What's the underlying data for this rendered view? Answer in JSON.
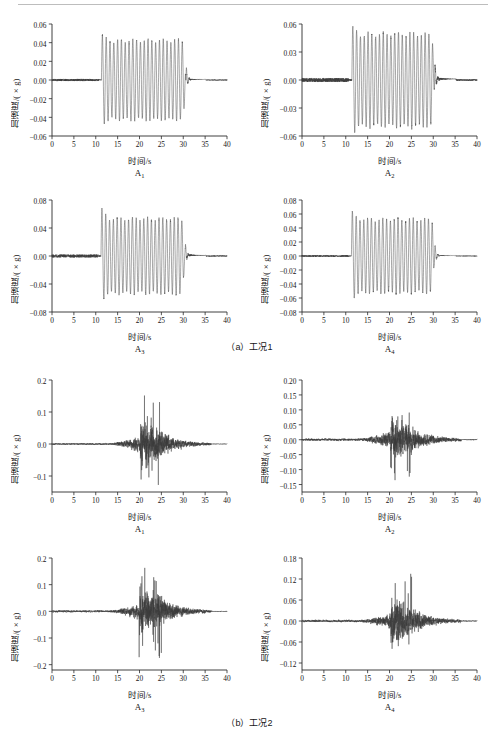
{
  "figure": {
    "axis_labels": {
      "y": "加速度/(×g)",
      "x": "时间/s"
    },
    "groups": [
      {
        "caption": "（a）工况1",
        "excitation": "harmonic-sine-sweep",
        "panels": [
          {
            "name": "A1",
            "label_main": "A",
            "label_sub": "1",
            "chart_data": {
              "type": "line",
              "title": "A1",
              "xlabel": "时间/s",
              "ylabel": "加速度/(×g)",
              "xlim": [
                0,
                40
              ],
              "ylim": [
                -0.06,
                0.06
              ],
              "xticks": [
                0,
                5,
                10,
                15,
                20,
                25,
                30,
                35,
                40
              ],
              "yticks": [
                -0.06,
                -0.04,
                -0.02,
                0.0,
                0.02,
                0.04,
                0.06
              ],
              "grid": false,
              "legend": "none",
              "waveform": "sine",
              "quiet_noise_amp": 0.0012,
              "onset_s": 11.3,
              "end_s": 30.6,
              "tail_end_s": 35.2,
              "peak_positive": 0.048,
              "peak_negative": -0.049,
              "steady_amp": 0.042,
              "cycles_per_second": 1.15
            }
          },
          {
            "name": "A2",
            "label_main": "A",
            "label_sub": "2",
            "chart_data": {
              "type": "line",
              "title": "A2",
              "xlabel": "时间/s",
              "ylabel": "加速度/(×g)",
              "xlim": [
                0,
                40
              ],
              "ylim": [
                -0.06,
                0.06
              ],
              "xticks": [
                0,
                5,
                10,
                15,
                20,
                25,
                30,
                35,
                40
              ],
              "yticks": [
                -0.06,
                -0.03,
                0.0,
                0.03,
                0.06
              ],
              "grid": false,
              "legend": "none",
              "waveform": "sine",
              "quiet_noise_amp": 0.0022,
              "onset_s": 11.4,
              "end_s": 30.3,
              "tail_end_s": 35.2,
              "peak_positive": 0.059,
              "peak_negative": -0.056,
              "steady_amp": 0.049,
              "cycles_per_second": 1.15
            }
          },
          {
            "name": "A3",
            "label_main": "A",
            "label_sub": "3",
            "chart_data": {
              "type": "line",
              "title": "A3",
              "xlabel": "时间/s",
              "ylabel": "加速度/(×g)",
              "xlim": [
                0,
                40
              ],
              "ylim": [
                -0.08,
                0.08
              ],
              "xticks": [
                0,
                5,
                10,
                15,
                20,
                25,
                30,
                35,
                40
              ],
              "yticks": [
                -0.08,
                -0.04,
                0.0,
                0.04,
                0.08
              ],
              "grid": false,
              "legend": "none",
              "waveform": "sine",
              "quiet_noise_amp": 0.0022,
              "onset_s": 11.2,
              "end_s": 30.4,
              "tail_end_s": 35.2,
              "peak_positive": 0.07,
              "peak_negative": -0.068,
              "steady_amp": 0.053,
              "cycles_per_second": 1.15
            }
          },
          {
            "name": "A4",
            "label_main": "A",
            "label_sub": "4",
            "chart_data": {
              "type": "line",
              "title": "A4",
              "xlabel": "时间/s",
              "ylabel": "加速度/(×g)",
              "xlim": [
                0,
                40
              ],
              "ylim": [
                -0.08,
                0.08
              ],
              "xticks": [
                0,
                5,
                10,
                15,
                20,
                25,
                30,
                35,
                40
              ],
              "yticks": [
                -0.08,
                -0.06,
                -0.04,
                -0.02,
                0.0,
                0.02,
                0.04,
                0.06,
                0.08
              ],
              "grid": false,
              "legend": "none",
              "waveform": "sine",
              "quiet_noise_amp": 0.0012,
              "onset_s": 11.3,
              "end_s": 30.3,
              "tail_end_s": 35.2,
              "peak_positive": 0.067,
              "peak_negative": -0.062,
              "steady_amp": 0.052,
              "cycles_per_second": 1.15
            }
          }
        ]
      },
      {
        "caption": "（b）工况2",
        "excitation": "seismic-random",
        "panels": [
          {
            "name": "A1",
            "label_main": "A",
            "label_sub": "1",
            "chart_data": {
              "type": "line",
              "title": "A1",
              "xlabel": "时间/s",
              "ylabel": "加速度/(×g)",
              "xlim": [
                0,
                40
              ],
              "ylim": [
                -0.15,
                0.2
              ],
              "xticks": [
                0,
                5,
                10,
                15,
                20,
                25,
                30,
                35,
                40
              ],
              "yticks": [
                -0.1,
                0.0,
                0.1,
                0.2
              ],
              "grid": false,
              "legend": "none",
              "waveform": "seismic",
              "quiet_noise_amp": 0.002,
              "onset_s": 13.0,
              "strong_start_s": 20.2,
              "strong_end_s": 24.5,
              "end_s": 36.4,
              "peak_positive": 0.158,
              "peak_negative": -0.128,
              "rms_strong": 0.045
            }
          },
          {
            "name": "A2",
            "label_main": "A",
            "label_sub": "2",
            "chart_data": {
              "type": "line",
              "title": "A2",
              "xlabel": "时间/s",
              "ylabel": "加速度/(×g)",
              "xlim": [
                0,
                40
              ],
              "ylim": [
                -0.175,
                0.2
              ],
              "xticks": [
                0,
                5,
                10,
                15,
                20,
                25,
                30,
                35,
                40
              ],
              "yticks": [
                -0.15,
                -0.1,
                -0.05,
                0.0,
                0.05,
                0.1,
                0.15,
                0.2
              ],
              "grid": false,
              "legend": "none",
              "waveform": "seismic",
              "quiet_noise_amp": 0.003,
              "onset_s": 13.0,
              "strong_start_s": 20.2,
              "strong_end_s": 24.5,
              "end_s": 36.4,
              "peak_positive": 0.163,
              "peak_negative": -0.138,
              "rms_strong": 0.048
            }
          },
          {
            "name": "A3",
            "label_main": "A",
            "label_sub": "3",
            "chart_data": {
              "type": "line",
              "title": "A3",
              "xlabel": "时间/s",
              "ylabel": "加速度/(×g)",
              "xlim": [
                0,
                40
              ],
              "ylim": [
                -0.22,
                0.2
              ],
              "xticks": [
                0,
                5,
                10,
                15,
                20,
                25,
                30,
                35,
                40
              ],
              "yticks": [
                -0.2,
                -0.1,
                0.0,
                0.1,
                0.2
              ],
              "grid": false,
              "legend": "none",
              "waveform": "seismic",
              "quiet_noise_amp": 0.003,
              "onset_s": 13.0,
              "strong_start_s": 20.0,
              "strong_end_s": 25.0,
              "end_s": 36.4,
              "peak_positive": 0.172,
              "peak_negative": -0.196,
              "rms_strong": 0.055
            }
          },
          {
            "name": "A4",
            "label_main": "A",
            "label_sub": "4",
            "chart_data": {
              "type": "line",
              "title": "A4",
              "xlabel": "时间/s",
              "ylabel": "加速度/(×g)",
              "xlim": [
                0,
                40
              ],
              "ylim": [
                -0.14,
                0.18
              ],
              "xticks": [
                0,
                5,
                10,
                15,
                20,
                25,
                30,
                35,
                40
              ],
              "yticks": [
                -0.12,
                -0.06,
                0.0,
                0.06,
                0.12,
                0.18
              ],
              "grid": false,
              "legend": "none",
              "waveform": "seismic",
              "quiet_noise_amp": 0.0025,
              "onset_s": 13.2,
              "strong_start_s": 20.3,
              "strong_end_s": 25.0,
              "end_s": 36.4,
              "peak_positive": 0.135,
              "peak_negative": -0.131,
              "rms_strong": 0.042
            }
          }
        ]
      }
    ]
  }
}
